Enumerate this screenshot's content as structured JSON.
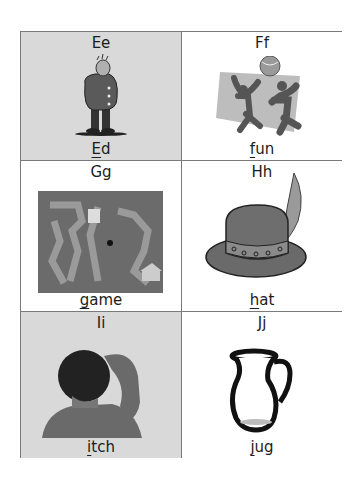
{
  "cards": [
    {
      "letters": "Ee",
      "word_first": "E",
      "word_rest": "d",
      "image": "man-in-coat",
      "shaded": true
    },
    {
      "letters": "Ff",
      "word_first": "f",
      "word_rest": "un",
      "image": "children-playing-ball",
      "shaded": false
    },
    {
      "letters": "Gg",
      "word_first": "g",
      "word_rest": "ame",
      "image": "board-game",
      "shaded": false
    },
    {
      "letters": "Hh",
      "word_first": "h",
      "word_rest": "at",
      "image": "hat-with-feather",
      "shaded": false
    },
    {
      "letters": "Ii",
      "word_first": "i",
      "word_rest": "tch",
      "image": "person-scratching-head",
      "shaded": true
    },
    {
      "letters": "Jj",
      "word_first": "j",
      "word_rest": "ug",
      "image": "jug",
      "shaded": false
    }
  ],
  "colors": {
    "shaded_cell": "#d9d9d9",
    "border": "#7a7a7a",
    "text": "#1c1c1c"
  }
}
